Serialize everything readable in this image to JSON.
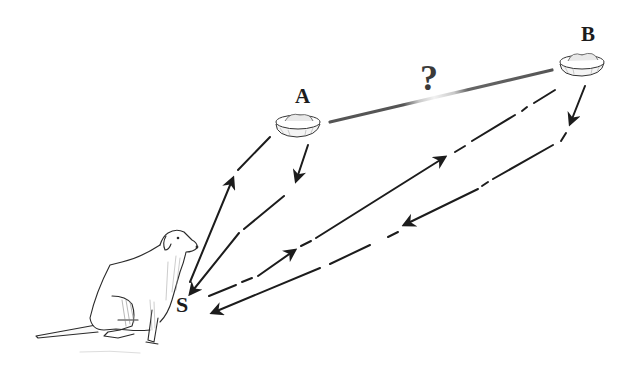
{
  "diagram": {
    "labels": {
      "a": "A",
      "b": "B",
      "s": "S",
      "unknown_shortcut": "?"
    },
    "nodes": [
      {
        "id": "S",
        "label": "S",
        "depicts": "sitting dog (start position)"
      },
      {
        "id": "A",
        "label": "A",
        "depicts": "food bowl A"
      },
      {
        "id": "B",
        "label": "B",
        "depicts": "food bowl B"
      }
    ],
    "edges": [
      {
        "from": "S",
        "to": "A",
        "style": "dashed",
        "arrow": "toward A"
      },
      {
        "from": "A",
        "to": "S",
        "style": "dashed",
        "arrow": "toward S"
      },
      {
        "from": "S",
        "to": "B",
        "style": "dash-dot",
        "arrow": "toward B"
      },
      {
        "from": "B",
        "to": "S",
        "style": "dash-dot",
        "arrow": "toward S"
      },
      {
        "from": "A",
        "to": "B",
        "style": "solid gray, unknown",
        "label": "?"
      }
    ],
    "colors": {
      "ink": "#1c1c1c",
      "shortcut": "#555555",
      "shortcut_fade": "#bdbdbd",
      "background": "#ffffff"
    }
  }
}
